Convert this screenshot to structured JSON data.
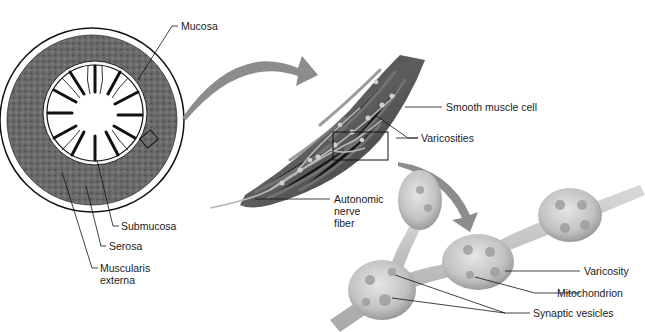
{
  "diagram": {
    "type": "anatomical-illustration",
    "panels": [
      {
        "id": "cross-section",
        "description": "Cross-section of intestine",
        "labels": {
          "mucosa": "Mucosa",
          "submucosa": "Submucosa",
          "serosa": "Serosa",
          "muscularis_externa_line1": "Muscularis",
          "muscularis_externa_line2": "externa"
        }
      },
      {
        "id": "muscle-band",
        "description": "Enlarged smooth muscle layer with nerve fiber",
        "labels": {
          "smooth_muscle_cell": "Smooth muscle cell",
          "varicosities": "Varicosities",
          "autonomic_line1": "Autonomic",
          "autonomic_line2": "nerve",
          "autonomic_line3": "fiber"
        }
      },
      {
        "id": "varicosity-detail",
        "description": "Detail of nerve varicosities",
        "labels": {
          "varicosity": "Varicosity",
          "mitochondrion": "Mitochondrion",
          "synaptic_vesicles": "Synaptic vesicles"
        }
      }
    ],
    "colors": {
      "arrow": "#8a8a8a",
      "muscle_dark": "#3a3a3a",
      "muscle_mid": "#6e6e6e",
      "ring": "#5a5a5a",
      "varicosity": "#c4c4c4",
      "leader_line": "#111111"
    }
  }
}
